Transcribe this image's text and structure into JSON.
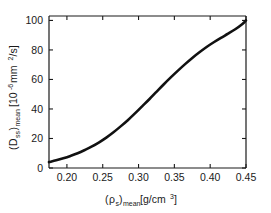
{
  "chart_data": {
    "type": "line",
    "title": "",
    "subtitle": "",
    "xlabel": "(ρs)mean[g/cm3]",
    "ylabel": "(Dss)mean [10-6 mm2/s]",
    "xlabel_parts": {
      "open_paren": "(",
      "rho": "ρ",
      "rho_sub": "s",
      "close_paren": ")",
      "mean_sub": "mean",
      "units": "[g/cm",
      "units_exp": "3",
      "units_close": "]"
    },
    "ylabel_parts": {
      "open_paren": "(",
      "D": "D",
      "D_sub": "ss",
      "close_paren": ")",
      "mean_sub": "mean",
      "bracket_open": "[10",
      "exp": "-6",
      "units": " mm",
      "units_exp": "2",
      "units_tail": "/s]"
    },
    "xlim": [
      0.175,
      0.45
    ],
    "ylim": [
      0,
      103
    ],
    "xticks": [
      0.2,
      0.25,
      0.3,
      0.35,
      0.4,
      0.45
    ],
    "xticklabels": [
      "0.20",
      "0.25",
      "0.30",
      "0.35",
      "0.40",
      "0.45"
    ],
    "yticks": [
      0,
      20,
      40,
      60,
      80,
      100
    ],
    "yticklabels": [
      "0",
      "20",
      "40",
      "60",
      "80",
      "100"
    ],
    "grid": false,
    "legend": null,
    "legend_position": "none",
    "series": [
      {
        "name": "Dss mean vs rho s mean",
        "color": "#111111",
        "x": [
          0.175,
          0.185,
          0.195,
          0.205,
          0.215,
          0.225,
          0.235,
          0.245,
          0.255,
          0.265,
          0.275,
          0.285,
          0.295,
          0.305,
          0.315,
          0.325,
          0.335,
          0.345,
          0.355,
          0.365,
          0.375,
          0.385,
          0.395,
          0.405,
          0.415,
          0.425,
          0.435,
          0.445,
          0.45
        ],
        "y": [
          4.0,
          5.2,
          6.6,
          8.2,
          10.0,
          12.2,
          14.6,
          17.4,
          20.6,
          24.2,
          28.2,
          32.4,
          37.0,
          41.8,
          46.6,
          51.6,
          56.6,
          61.4,
          66.0,
          70.4,
          74.6,
          78.4,
          82.0,
          85.2,
          88.2,
          91.0,
          94.0,
          97.6,
          100.0
        ]
      }
    ],
    "annotations": []
  },
  "axes": {
    "spine_color": "#1a1a1a",
    "tick_color": "#1a1a1a",
    "background": "#ffffff"
  }
}
